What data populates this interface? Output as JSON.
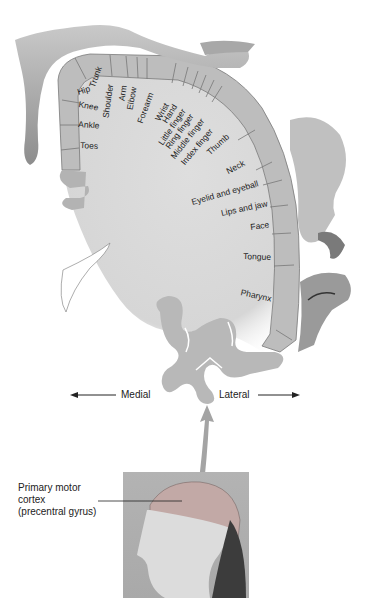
{
  "diagram": {
    "colors": {
      "cortex_fill": "#d9d9d9",
      "gyrus_band": "#b8b8b8",
      "band_outline": "#6f6f6f",
      "figure_gray": "#9a9a9a",
      "background": "#ffffff"
    },
    "body_regions": [
      {
        "label": "Hip"
      },
      {
        "label": "Trunk"
      },
      {
        "label": "Knee"
      },
      {
        "label": "Shoulder"
      },
      {
        "label": "Arm"
      },
      {
        "label": "Elbow"
      },
      {
        "label": "Ankle"
      },
      {
        "label": "Forearm"
      },
      {
        "label": "Wrist"
      },
      {
        "label": "Hand"
      },
      {
        "label": "Little finger"
      },
      {
        "label": "Ring finger"
      },
      {
        "label": "Middle finger"
      },
      {
        "label": "Index finger"
      },
      {
        "label": "Toes"
      },
      {
        "label": "Thumb"
      },
      {
        "label": "Neck"
      },
      {
        "label": "Eyelid and eyeball"
      },
      {
        "label": "Lips and jaw"
      },
      {
        "label": "Face"
      },
      {
        "label": "Tongue"
      },
      {
        "label": "Pharynx"
      }
    ],
    "orientation": {
      "medial": "Medial",
      "lateral": "Lateral"
    },
    "inset_caption": {
      "line1": "Primary motor",
      "line2": "cortex",
      "line3": "(precentral gyrus)"
    }
  }
}
